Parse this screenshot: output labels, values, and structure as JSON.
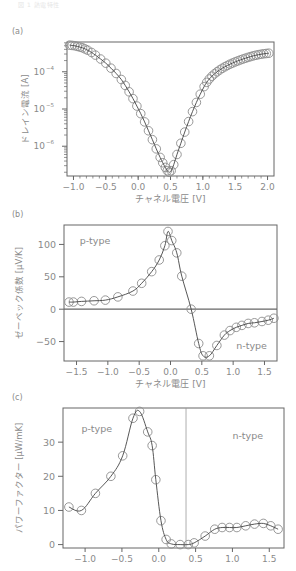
{
  "header": {
    "caption": "図 1 熱電特性"
  },
  "colors": {
    "axis": "#666666",
    "line": "#444444",
    "marker": "#8c8c8c",
    "text": "#8a8a8a",
    "guide": "#999999"
  },
  "chart_data": [
    {
      "panel": "(a)",
      "type": "line",
      "scale_y": "log",
      "title": "",
      "xlabel": "チャネル電圧 [V]",
      "ylabel": "ドレイン電流 [A]",
      "xlim": [
        -1.1,
        2.1
      ],
      "ylim_log10": [
        -6.8,
        -3.2
      ],
      "xticks": [
        -1.0,
        -0.5,
        0.0,
        0.5,
        1.0,
        1.5,
        2.0
      ],
      "xtick_labels": [
        "−1.0",
        "−0.5",
        "0.0",
        "0.5",
        "1.0",
        "1.5",
        "2.0"
      ],
      "yticks_log10": [
        -4,
        -5,
        -6
      ],
      "ytick_labels": [
        "10",
        "10",
        "10"
      ],
      "ytick_exponents": [
        "−4",
        "−5",
        "−6"
      ],
      "grid": false,
      "legend": null,
      "series": [
        {
          "name": "drain current",
          "marker": "circle-open",
          "x": [
            -1.06,
            -1.02,
            -0.98,
            -0.94,
            -0.9,
            -0.86,
            -0.82,
            -0.78,
            -0.72,
            -0.66,
            -0.58,
            -0.5,
            -0.42,
            -0.34,
            -0.26,
            -0.2,
            -0.14,
            -0.08,
            -0.02,
            0.04,
            0.1,
            0.16,
            0.22,
            0.28,
            0.34,
            0.38,
            0.42,
            0.45,
            0.48,
            0.51,
            0.55,
            0.6,
            0.66,
            0.72,
            0.78,
            0.84,
            0.9,
            0.96,
            1.02,
            1.06,
            1.1,
            1.14,
            1.18,
            1.22,
            1.26,
            1.3,
            1.34,
            1.38,
            1.42,
            1.46,
            1.5,
            1.54,
            1.58,
            1.62,
            1.66,
            1.7,
            1.74,
            1.78,
            1.82,
            1.86,
            1.9,
            1.94,
            1.98,
            2.02
          ],
          "y": [
            0.00052,
            0.00051,
            0.0005,
            0.00048,
            0.00046,
            0.00044,
            0.00041,
            0.00038,
            0.00033,
            0.00028,
            0.00022,
            0.00017,
            0.000125,
            9e-05,
            6.2e-05,
            4.3e-05,
            2.9e-05,
            1.9e-05,
            1.2e-05,
            7.5e-06,
            4.5e-06,
            2.6e-06,
            1.5e-06,
            8.5e-07,
            5e-07,
            3.6e-07,
            2.7e-07,
            2.2e-07,
            2e-07,
            2.2e-07,
            3.2e-07,
            6e-07,
            1.2e-06,
            2.4e-06,
            4.6e-06,
            8.5e-06,
            1.5e-05,
            2.5e-05,
            4e-05,
            5.2e-05,
            6.4e-05,
            7.6e-05,
            8.8e-05,
            0.0001,
            0.000112,
            0.000124,
            0.000136,
            0.000148,
            0.00016,
            0.000172,
            0.000184,
            0.000196,
            0.000208,
            0.00022,
            0.000232,
            0.000244,
            0.000256,
            0.000268,
            0.000278,
            0.000288,
            0.000296,
            0.000304,
            0.00031,
            0.000315
          ]
        }
      ],
      "frame_px": {
        "left": 67,
        "top": 42,
        "right": 274,
        "bottom": 176
      }
    },
    {
      "panel": "(b)",
      "type": "line",
      "title": "",
      "xlabel": "チャネル電圧 [V]",
      "ylabel": "ゼーベック係数 [μV/K]",
      "xlim": [
        -1.7,
        1.7
      ],
      "ylim": [
        -80,
        130
      ],
      "xticks": [
        -1.5,
        -1.0,
        -0.5,
        0.0,
        0.5,
        1.0,
        1.5
      ],
      "xtick_labels": [
        "−1.5",
        "−1.0",
        "−0.5",
        "0.0",
        "0.5",
        "1.0",
        "1.5"
      ],
      "yticks": [
        100,
        50,
        0,
        -50
      ],
      "ytick_labels": [
        "100",
        "50",
        "0",
        "−50"
      ],
      "zero_line": true,
      "grid": false,
      "annotations": [
        {
          "text": "p-type",
          "x": -1.45,
          "y": 100
        },
        {
          "text": "n-type",
          "x": 1.05,
          "y": -62
        }
      ],
      "series": [
        {
          "name": "Seebeck coefficient",
          "marker": "circle-open",
          "x": [
            -1.62,
            -1.55,
            -1.42,
            -1.22,
            -1.04,
            -0.84,
            -0.6,
            -0.46,
            -0.3,
            -0.18,
            -0.09,
            -0.04,
            0.02,
            0.1,
            0.18,
            0.33,
            0.45,
            0.52,
            0.62,
            0.74,
            0.86,
            0.95,
            1.05,
            1.14,
            1.24,
            1.34,
            1.46,
            1.56,
            1.65
          ],
          "y": [
            11,
            11,
            12,
            13,
            14,
            19,
            28,
            40,
            58,
            76,
            98,
            120,
            106,
            87,
            51,
            0,
            -53,
            -72,
            -72,
            -56,
            -40,
            -33,
            -28,
            -25,
            -22,
            -21,
            -19,
            -17,
            -14
          ]
        }
      ],
      "frame_px": {
        "left": 64,
        "top": 225,
        "right": 277,
        "bottom": 361
      }
    },
    {
      "panel": "(c)",
      "type": "line",
      "title": "",
      "xlabel": "",
      "ylabel": "パワーファクター [μW/mK]",
      "xlim": [
        -1.3,
        1.7
      ],
      "ylim": [
        -1,
        40
      ],
      "xticks": [
        -1.0,
        -0.5,
        0.0,
        0.5,
        1.0,
        1.5
      ],
      "xtick_labels": [
        "−1.0",
        "−0.5",
        "0.0",
        "0.5",
        "1.0",
        "1.5"
      ],
      "yticks": [
        30,
        20,
        10,
        0
      ],
      "ytick_labels": [
        "30",
        "20",
        "10",
        "0"
      ],
      "vline_x": 0.37,
      "grid": false,
      "annotations": [
        {
          "text": "p-type",
          "x": -1.05,
          "y": 33
        },
        {
          "text": "n-type",
          "x": 1.0,
          "y": 31
        }
      ],
      "series": [
        {
          "name": "power factor",
          "marker": "circle-open",
          "x": [
            -1.22,
            -1.05,
            -0.86,
            -0.65,
            -0.49,
            -0.35,
            -0.26,
            -0.15,
            -0.09,
            -0.04,
            0.03,
            0.1,
            0.17,
            0.29,
            0.4,
            0.48,
            0.63,
            0.76,
            0.86,
            0.96,
            1.06,
            1.18,
            1.3,
            1.42,
            1.52,
            1.62
          ],
          "y": [
            11,
            10,
            15,
            20,
            26,
            37,
            39,
            33,
            29,
            19,
            7,
            1.5,
            0.2,
            0,
            0,
            0.5,
            2.5,
            4.5,
            5,
            5,
            5,
            5.5,
            6,
            6.2,
            5.5,
            4.5
          ]
        }
      ],
      "frame_px": {
        "left": 63,
        "top": 408,
        "right": 284,
        "bottom": 548
      }
    }
  ]
}
